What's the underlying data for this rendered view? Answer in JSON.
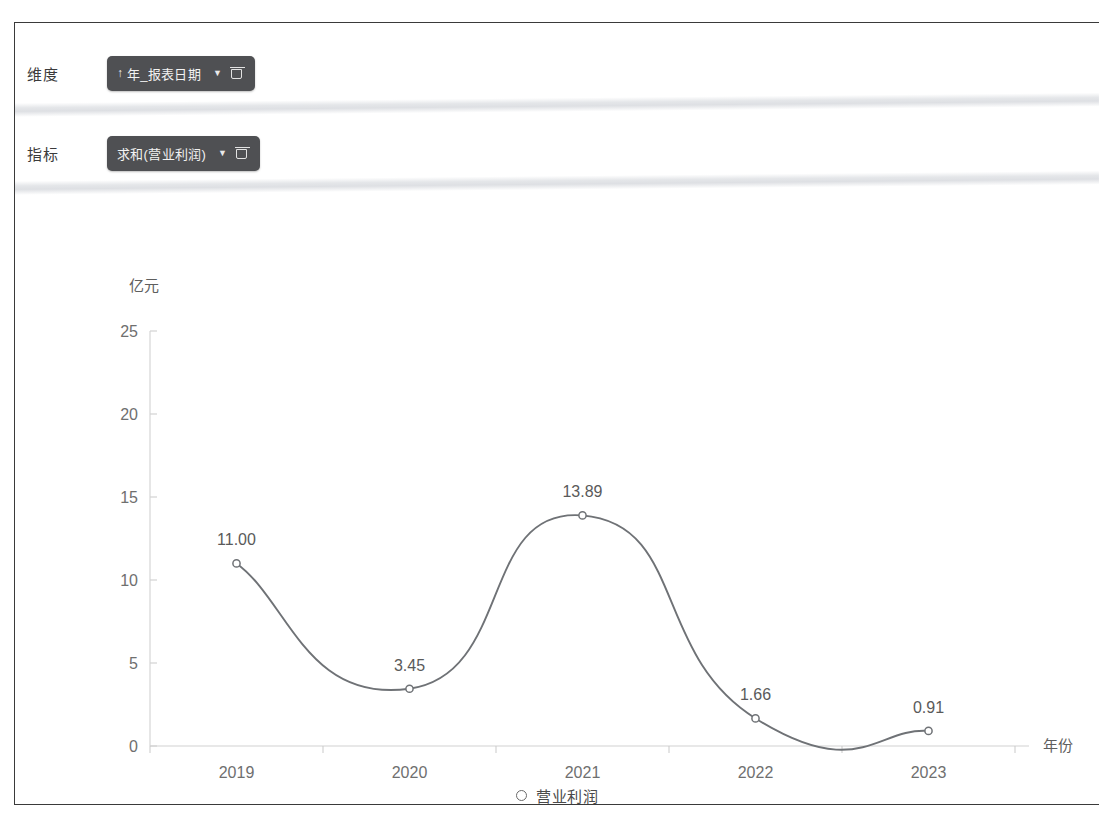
{
  "shelves": [
    {
      "label": "维度",
      "chip": {
        "sort_indicator": "↑",
        "text": "年_报表日期",
        "caret_icon": "chevron-down-icon",
        "delete_icon": "trash-icon"
      }
    },
    {
      "label": "指标",
      "chip": {
        "sort_indicator": "",
        "text": "求和(营业利润)",
        "caret_icon": "chevron-down-icon",
        "delete_icon": "trash-icon"
      }
    }
  ],
  "legend": {
    "marker_icon": "hollow-circle-icon",
    "label": "营业利润"
  },
  "colors": {
    "chip_background": "#4f5053",
    "chip_text": "#f2f2f2",
    "line": "#6f7276",
    "axis": "#d2d2d2",
    "label_text": "#5a5a5a",
    "panel_border": "#3a3a3a"
  },
  "chart_data": {
    "type": "line",
    "title": "",
    "categories": [
      "2019",
      "2020",
      "2021",
      "2022",
      "2023"
    ],
    "series": [
      {
        "name": "营业利润",
        "values": [
          11.0,
          3.45,
          13.89,
          1.66,
          0.91
        ],
        "labels": [
          "11.00",
          "3.45",
          "13.89",
          "1.66",
          "0.91"
        ]
      }
    ],
    "xlabel": "年份",
    "ylabel": "亿元",
    "ylim": [
      0,
      25
    ],
    "yticks": [
      0,
      5,
      10,
      15,
      20,
      25
    ],
    "ytick_labels": [
      "0",
      "5",
      "10",
      "15",
      "20",
      "25"
    ],
    "grid": false,
    "smooth": true,
    "legend_position": "bottom"
  }
}
